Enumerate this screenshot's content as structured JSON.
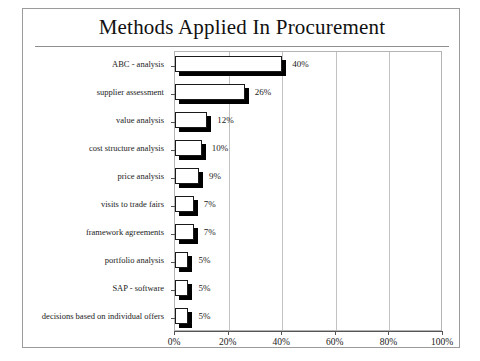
{
  "chart_data": {
    "type": "bar",
    "orientation": "horizontal",
    "title": "Methods Applied In Procurement",
    "xlabel": "",
    "ylabel": "",
    "xlim": [
      0,
      100
    ],
    "xticks": [
      "0%",
      "20%",
      "40%",
      "60%",
      "80%",
      "100%"
    ],
    "xtick_values": [
      0,
      20,
      40,
      60,
      80,
      100
    ],
    "grid": true,
    "legend": false,
    "categories": [
      "ABC - analysis",
      "supplier assessment",
      "value analysis",
      "cost structure analysis",
      "price analysis",
      "visits to trade fairs",
      "framework agreements",
      "portfolio analysis",
      "SAP - software",
      "decisions based on individual offers"
    ],
    "values": [
      40,
      26,
      12,
      10,
      9,
      7,
      7,
      5,
      5,
      5
    ],
    "data_labels": [
      "40%",
      "26%",
      "12%",
      "10%",
      "9%",
      "7%",
      "7%",
      "5%",
      "5%",
      "5%"
    ],
    "style": {
      "bar_face_color": "#ffffff",
      "bar_edge_color": "#1a1a1a",
      "bar_shadow_color": "#000000",
      "grid_color": "#c2c2c2",
      "axis_color": "#555555",
      "frame_color": "#9b9b9b",
      "background": "#ffffff"
    }
  }
}
